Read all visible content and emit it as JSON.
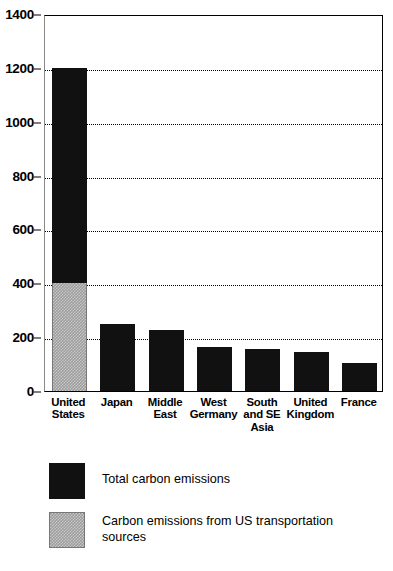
{
  "chart_data": {
    "type": "bar",
    "title": "",
    "subtitle": "",
    "xlabel": "",
    "ylabel": "",
    "ylim": [
      0,
      1400
    ],
    "ytick_step": 200,
    "yticks": [
      0,
      200,
      400,
      600,
      800,
      1000,
      1200,
      1400
    ],
    "ytick_labels": [
      "0",
      "200",
      "400",
      "600",
      "800",
      "1000",
      "1200",
      "1400"
    ],
    "grid": true,
    "grid_style": "dotted-horizontal",
    "legend_position": "below-plot-left",
    "categories": [
      "United States",
      "Japan",
      "Middle East",
      "West Germany",
      "South and SE Asia",
      "United Kingdom",
      "France"
    ],
    "category_label_lines": [
      [
        "United",
        "States"
      ],
      [
        "Japan"
      ],
      [
        "Middle",
        "East"
      ],
      [
        "West",
        "Germany"
      ],
      [
        "South",
        "and SE",
        "Asia"
      ],
      [
        "United",
        "Kingdom"
      ],
      [
        "France"
      ]
    ],
    "series": [
      {
        "name": "Total carbon emissions",
        "color": "#111111",
        "values": [
          1200,
          250,
          225,
          165,
          155,
          145,
          105
        ]
      },
      {
        "name": "Carbon emissions from US transportation sources",
        "color": "#9d9d9d",
        "values": [
          400,
          0,
          0,
          0,
          0,
          0,
          0
        ]
      }
    ],
    "stacked_note": "United States bar is segmented: lower 400 is US transportation sources (gray), full bar total is 1200 (black)",
    "annotations": []
  },
  "legend": {
    "items": [
      {
        "label": "Total carbon emissions",
        "swatch": "black"
      },
      {
        "label": "Carbon emissions from US transportation sources",
        "swatch": "gray"
      }
    ]
  },
  "colors": {
    "bar_total": "#111111",
    "bar_transport": "#9d9d9d",
    "axis": "#000000",
    "grid": "#000000",
    "background": "#ffffff"
  }
}
